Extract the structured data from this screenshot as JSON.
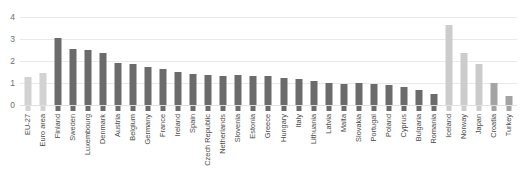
{
  "chart_data": {
    "type": "bar",
    "title": "",
    "subtitle": "",
    "xlabel": "",
    "ylabel": "",
    "ylim": [
      0,
      4.4
    ],
    "yticks": [
      0,
      1,
      2,
      3,
      4
    ],
    "ytick_labels": [
      "0",
      "1",
      "2",
      "3",
      "4"
    ],
    "grid": true,
    "gridlines_horizontal": true,
    "legend": null,
    "legend_position": "none",
    "categories": [
      "EU-27",
      "Euro area",
      "Finland",
      "Sweden",
      "Luxembourg",
      "Denmark",
      "Austria",
      "Belgium",
      "Germany",
      "France",
      "Ireland",
      "Spain",
      "Czech Republic",
      "Netherlands",
      "Slovenia",
      "Estonia",
      "Greece",
      "Hungary",
      "Italy",
      "Lithuania",
      "Latvia",
      "Malta",
      "Slovakia",
      "Portugal",
      "Poland",
      "Cyprus",
      "Bulgaria",
      "Romania",
      "Iceland",
      "Norway",
      "Japan",
      "Croatia",
      "Turkey"
    ],
    "values": [
      1.27,
      1.45,
      3.03,
      2.53,
      2.48,
      2.37,
      1.92,
      1.87,
      1.72,
      1.65,
      1.5,
      1.42,
      1.37,
      1.3,
      1.35,
      1.33,
      1.33,
      1.22,
      1.18,
      1.1,
      1.0,
      0.95,
      1.0,
      0.95,
      0.9,
      0.82,
      0.68,
      0.5,
      3.65,
      2.36,
      1.86,
      1.0,
      0.4
    ],
    "bar_colors": [
      "#d2d2d2",
      "#d2d2d2",
      "#6b6b6b",
      "#6b6b6b",
      "#6b6b6b",
      "#6b6b6b",
      "#6b6b6b",
      "#6b6b6b",
      "#6b6b6b",
      "#6b6b6b",
      "#6b6b6b",
      "#6b6b6b",
      "#6b6b6b",
      "#6b6b6b",
      "#6b6b6b",
      "#6b6b6b",
      "#6b6b6b",
      "#6b6b6b",
      "#6b6b6b",
      "#6b6b6b",
      "#6b6b6b",
      "#6b6b6b",
      "#6b6b6b",
      "#6b6b6b",
      "#6b6b6b",
      "#6b6b6b",
      "#6b6b6b",
      "#6b6b6b",
      "#cccccc",
      "#cccccc",
      "#cbcbcb",
      "#a3a3a3",
      "#a3a3a3"
    ]
  },
  "axis": {
    "gridline_color": "#e9e9e9",
    "tick_label_color": "#6e6e6e",
    "category_label_color": "#4a4a4a"
  }
}
